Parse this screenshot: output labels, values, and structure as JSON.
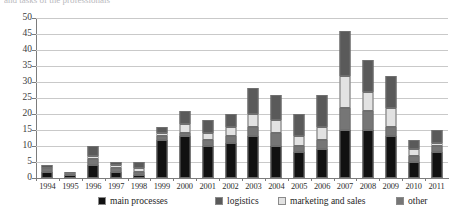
{
  "caption_sliver": "and tasks of the professionals",
  "chart_data": {
    "type": "bar",
    "title": "",
    "subtitle": "",
    "xlabel": "",
    "ylabel": "",
    "stacked": true,
    "grid": true,
    "legend_position": "bottom",
    "ylim": [
      0,
      50
    ],
    "yticks": [
      0,
      5,
      10,
      15,
      20,
      25,
      30,
      35,
      40,
      45,
      50
    ],
    "ytick_labels": [
      "0",
      "5",
      "10",
      "15",
      "20",
      "25",
      "30",
      "35",
      "40",
      "45",
      "50"
    ],
    "categories": [
      "1994",
      "1995",
      "1996",
      "1997",
      "1998",
      "1999",
      "2000",
      "2001",
      "2002",
      "2003",
      "2004",
      "2005",
      "2006",
      "2007",
      "2008",
      "2009",
      "2010",
      "2011"
    ],
    "series": [
      {
        "name": "main processes",
        "color": "#111111",
        "values": [
          2,
          1,
          4,
          2,
          1,
          12,
          13,
          10,
          11,
          13,
          10,
          8,
          9,
          15,
          15,
          13,
          5,
          8
        ]
      },
      {
        "name": "other",
        "color": "#767676",
        "values": [
          1,
          1,
          2,
          1,
          1,
          1,
          1,
          2,
          2,
          3,
          4,
          2,
          3,
          7,
          6,
          3,
          2,
          2
        ]
      },
      {
        "name": "marketing and sales",
        "color": "#e2e2e2",
        "values": [
          0,
          0,
          1,
          1,
          1,
          1,
          3,
          2,
          3,
          4,
          4,
          3,
          4,
          10,
          6,
          6,
          2,
          1
        ]
      },
      {
        "name": "logistics",
        "color": "#5a5a5a",
        "values": [
          1,
          0,
          3,
          1,
          2,
          2,
          4,
          4,
          4,
          8,
          8,
          7,
          10,
          14,
          10,
          10,
          3,
          4
        ]
      }
    ],
    "totals": [
      4,
      2,
      10,
      5,
      5,
      16,
      21,
      18,
      20,
      28,
      26,
      20,
      26,
      46,
      37,
      32,
      12,
      15
    ]
  },
  "legend": {
    "items": [
      {
        "label": "main processes",
        "color": "#111111"
      },
      {
        "label": "logistics",
        "color": "#5a5a5a"
      },
      {
        "label": "marketing and sales",
        "color": "#e2e2e2"
      },
      {
        "label": "other",
        "color": "#767676"
      }
    ]
  }
}
